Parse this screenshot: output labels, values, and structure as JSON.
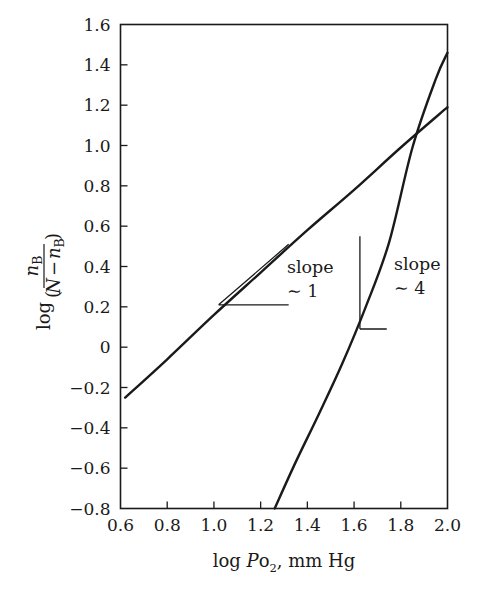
{
  "chart_data": {
    "type": "line",
    "title": "",
    "xlabel": "log Po2, mm Hg",
    "xlabel_parts": {
      "prefix": "log ",
      "italic": "P",
      "roman": "o",
      "sub": "2",
      "suffix": ", mm Hg"
    },
    "ylabel": "log ( nB / (N - nB) )",
    "ylabel_parts": {
      "log": "log",
      "num_base": "n",
      "num_sub": "B",
      "den_n": "N",
      "den_minus": "−",
      "den_base": "n",
      "den_sub": "B"
    },
    "xlim": [
      0.6,
      2.0
    ],
    "ylim": [
      -0.8,
      1.6
    ],
    "xticks": [
      0.6,
      0.8,
      1.0,
      1.2,
      1.4,
      1.6,
      1.8,
      2.0
    ],
    "xticklabels": [
      "0.6",
      "0.8",
      "1.0",
      "1.2",
      "1.4",
      "1.6",
      "1.8",
      "2.0"
    ],
    "yticks": [
      -0.8,
      -0.6,
      -0.4,
      -0.2,
      0,
      0.2,
      0.4,
      0.6,
      0.8,
      1.0,
      1.2,
      1.4,
      1.6
    ],
    "yticklabels": [
      "−0.8",
      "−0.6",
      "−0.4",
      "−0.2",
      "0",
      "0.2",
      "0.4",
      "0.6",
      "0.8",
      "1.0",
      "1.2",
      "1.4",
      "1.6"
    ],
    "grid": false,
    "legend": "none",
    "series": [
      {
        "name": "slope ~ 1 curve",
        "x": [
          0.62,
          0.8,
          1.0,
          1.2,
          1.4,
          1.6,
          1.8,
          2.0
        ],
        "y": [
          -0.25,
          -0.06,
          0.16,
          0.37,
          0.58,
          0.78,
          0.99,
          1.19
        ]
      },
      {
        "name": "slope ~ 4 curve",
        "x": [
          1.26,
          1.35,
          1.45,
          1.55,
          1.65,
          1.75,
          1.85,
          1.95,
          2.0
        ],
        "y": [
          -0.8,
          -0.57,
          -0.33,
          -0.08,
          0.2,
          0.52,
          0.99,
          1.33,
          1.46
        ]
      }
    ],
    "annotations": [
      {
        "name": "slope-1",
        "label_line1": "slope",
        "label_line2": "∼ 1",
        "slope_value": 1,
        "x": 1.32,
        "y": 0.21
      },
      {
        "name": "slope-4",
        "label_line1": "slope",
        "label_line2": "∼ 4",
        "slope_value": 4,
        "x": 1.74,
        "y": 0.09
      }
    ],
    "intersection": {
      "x": 1.86,
      "y": 1.04
    },
    "colors": {
      "ink": "#1a1a1a",
      "background": "#ffffff"
    }
  }
}
